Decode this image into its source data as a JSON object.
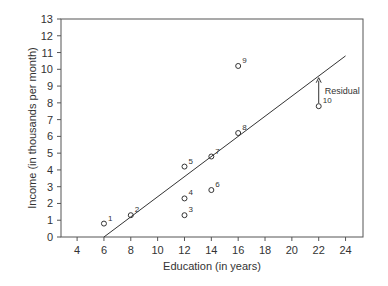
{
  "chart_data": {
    "type": "scatter",
    "title": "",
    "xlabel": "Education (in years)",
    "ylabel": "Income (in thousands per month)",
    "xlim": [
      2.8,
      25.3
    ],
    "ylim": [
      0,
      13
    ],
    "x_ticks": [
      4,
      6,
      8,
      10,
      12,
      14,
      16,
      18,
      20,
      22,
      24
    ],
    "y_ticks": [
      0,
      1,
      2,
      3,
      4,
      5,
      6,
      7,
      8,
      9,
      10,
      11,
      12,
      13
    ],
    "grid": false,
    "legend": null,
    "points": [
      {
        "label": "1",
        "x": 6,
        "y": 0.8
      },
      {
        "label": "2",
        "x": 8,
        "y": 1.3
      },
      {
        "label": "3",
        "x": 12,
        "y": 1.3
      },
      {
        "label": "4",
        "x": 12,
        "y": 2.3
      },
      {
        "label": "5",
        "x": 12,
        "y": 4.2
      },
      {
        "label": "6",
        "x": 14,
        "y": 2.8
      },
      {
        "label": "7",
        "x": 14,
        "y": 4.8
      },
      {
        "label": "8",
        "x": 16,
        "y": 6.2
      },
      {
        "label": "9",
        "x": 16,
        "y": 10.2
      },
      {
        "label": "10",
        "x": 22,
        "y": 7.8
      }
    ],
    "regression_line": {
      "x1": 6,
      "y1": 0,
      "x2": 24,
      "y2": 10.8
    },
    "annotations": [
      {
        "text": "Residual",
        "type": "arrow",
        "x": 22,
        "y_from": 7.8,
        "y_to": 9.5
      }
    ]
  },
  "colors": {
    "axis": "#555555",
    "line": "#333333",
    "marker": "#333333",
    "text": "#333333"
  }
}
